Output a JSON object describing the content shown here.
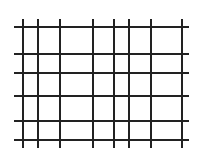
{
  "diagram": {
    "type": "grid",
    "caption": "",
    "line_color": "#222222",
    "background": "#ffffff",
    "horizontal_lines": {
      "x_start": 14,
      "x_end": 189,
      "y_positions": [
        26,
        53,
        72,
        95,
        120,
        139
      ]
    },
    "vertical_lines": {
      "y_start": 19,
      "y_end": 148,
      "x_positions": [
        22,
        37,
        59,
        92,
        113,
        128,
        150,
        181
      ]
    }
  }
}
